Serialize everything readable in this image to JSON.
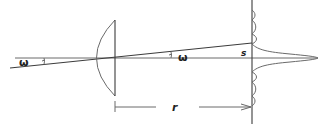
{
  "diagram": {
    "labels": {
      "angle_left": "ω",
      "angle_right": "ω",
      "spot_offset": "s",
      "distance": "r"
    },
    "elements": {
      "lens": "plano-convex lens",
      "screen": "observation screen",
      "ray": "oblique ray at angle ω",
      "axis": "optical axis",
      "intensity_profile": "diffraction intensity profile with central peak and side lobes",
      "dimension": "distance r from lens to screen"
    }
  }
}
